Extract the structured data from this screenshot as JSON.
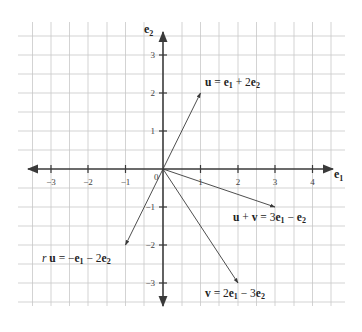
{
  "diagram": {
    "origin_label": "0",
    "axes": {
      "x": {
        "label": "e",
        "label_sub": "1",
        "ticks": [
          "−3",
          "−2",
          "−1",
          "1",
          "2",
          "3",
          "4"
        ]
      },
      "y": {
        "label": "e",
        "label_sub": "2",
        "ticks": [
          "3",
          "2",
          "1",
          "−1",
          "−2",
          "−3"
        ]
      }
    },
    "vectors": [
      {
        "name": "u",
        "components": [
          1,
          2
        ],
        "label_parts": [
          "u",
          " = ",
          "e",
          "1",
          " + 2",
          "e",
          "2"
        ]
      },
      {
        "name": "v",
        "components": [
          2,
          -3
        ],
        "label_parts": [
          "v",
          " = 2",
          "e",
          "1",
          " − 3",
          "e",
          "2"
        ]
      },
      {
        "name": "u+v",
        "components": [
          3,
          -1
        ],
        "label_parts": [
          "u",
          " + ",
          "v",
          " = 3",
          "e",
          "1",
          " − ",
          "e",
          "2"
        ]
      },
      {
        "name": "ru",
        "components": [
          -1,
          -2
        ],
        "label_parts": [
          "r ",
          "u",
          " = −",
          "e",
          "1",
          " − 2",
          "e",
          "2"
        ]
      }
    ],
    "colors": {
      "grid": "#c8c8c8",
      "axis": "#3a3a3a",
      "text": "#222222"
    }
  }
}
